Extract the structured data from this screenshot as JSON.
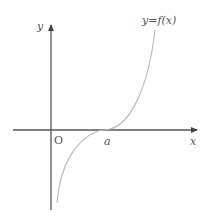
{
  "figure": {
    "title": "",
    "curve_label": "y=f(x)",
    "origin_label": "O",
    "x_axis_label": "x",
    "y_axis_label": "y",
    "point_label": "a"
  },
  "colors": {
    "axis": "#555555",
    "curve": "#bdbdbd",
    "text": "#555555",
    "background": "#ffffff"
  }
}
